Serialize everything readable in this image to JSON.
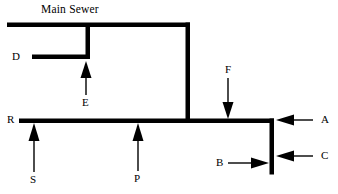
{
  "diagram": {
    "title": "Main Sewer",
    "stroke_color": "#000000",
    "background_color": "#ffffff",
    "labels": {
      "title": "Main Sewer",
      "d": "D",
      "e": "E",
      "f": "F",
      "r": "R",
      "s": "S",
      "p": "P",
      "a": "A",
      "b": "B",
      "c": "C"
    },
    "nodes": [
      {
        "id": "title",
        "text": "Main Sewer",
        "x": 40,
        "y": 2,
        "role": "diagram-title"
      },
      {
        "id": "D",
        "text": "D",
        "x": 12,
        "y": 50,
        "role": "branch-label"
      },
      {
        "id": "E",
        "text": "E",
        "x": 81,
        "y": 97,
        "role": "flow-label"
      },
      {
        "id": "F",
        "text": "F",
        "x": 224,
        "y": 64,
        "role": "flow-label"
      },
      {
        "id": "R",
        "text": "R",
        "x": 7,
        "y": 113,
        "role": "branch-label"
      },
      {
        "id": "S",
        "text": "S",
        "x": 29,
        "y": 174,
        "role": "flow-label"
      },
      {
        "id": "P",
        "text": "P",
        "x": 133,
        "y": 173,
        "role": "flow-label"
      },
      {
        "id": "A",
        "text": "A",
        "x": 320,
        "y": 114,
        "role": "flow-label"
      },
      {
        "id": "B",
        "text": "B",
        "x": 216,
        "y": 157,
        "role": "flow-label"
      },
      {
        "id": "C",
        "text": "C",
        "x": 320,
        "y": 150,
        "role": "flow-label"
      }
    ],
    "pipes": [
      {
        "id": "main-sewer-top",
        "orientation": "horizontal",
        "x1": 7,
        "x2": 190,
        "y": 25
      },
      {
        "id": "branch-d",
        "orientation": "horizontal",
        "x1": 32,
        "x2": 90,
        "y": 57
      },
      {
        "id": "riser-e",
        "orientation": "vertical",
        "x": 88,
        "y1": 25,
        "y2": 59
      },
      {
        "id": "main-down-riser",
        "orientation": "vertical",
        "x": 188,
        "y1": 25,
        "y2": 123
      },
      {
        "id": "lower-main",
        "orientation": "horizontal",
        "x1": 19,
        "x2": 274,
        "y": 121
      },
      {
        "id": "right-stack",
        "orientation": "vertical",
        "x": 272,
        "y1": 118,
        "y2": 174
      }
    ],
    "arrows": [
      {
        "id": "arrow-e",
        "label": "E",
        "direction": "up",
        "x": 86,
        "from_y": 95,
        "to_y": 62
      },
      {
        "id": "arrow-f",
        "label": "F",
        "direction": "down",
        "x": 228,
        "from_y": 78,
        "to_y": 119
      },
      {
        "id": "arrow-s",
        "label": "S",
        "direction": "up",
        "x": 34,
        "from_y": 172,
        "to_y": 124
      },
      {
        "id": "arrow-p",
        "label": "P",
        "direction": "up",
        "x": 138,
        "from_y": 171,
        "to_y": 124
      },
      {
        "id": "arrow-a",
        "label": "A",
        "direction": "left",
        "from_x": 313,
        "to_x": 277,
        "y": 120
      },
      {
        "id": "arrow-c",
        "label": "C",
        "direction": "left",
        "from_x": 313,
        "to_x": 277,
        "y": 156
      },
      {
        "id": "arrow-b",
        "label": "B",
        "direction": "right",
        "from_x": 228,
        "to_x": 270,
        "y": 163
      }
    ]
  }
}
